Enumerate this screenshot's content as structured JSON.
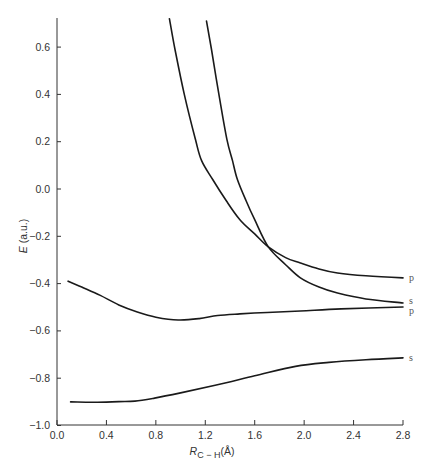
{
  "chart_data": {
    "type": "line",
    "title": "",
    "xlabel": "R_C−H (Å)",
    "xlabel_main": "R",
    "xlabel_sub": "C − H",
    "xlabel_unit": "(Å)",
    "ylabel": "E (a.u.)",
    "ylabel_main": "E",
    "ylabel_unit": "(a.u.)",
    "xlim": [
      0.0,
      2.8
    ],
    "ylim": [
      -1.0,
      0.72
    ],
    "grid": false,
    "legend": "none (curves labeled at right end)",
    "x_ticks": [
      "0.0",
      "0.4",
      "0.8",
      "1.2",
      "1.6",
      "2.0",
      "2.4",
      "2.8"
    ],
    "y_ticks": [
      "0.6",
      "0.4",
      "0.2",
      "0.0",
      "−0.2",
      "−0.4",
      "−0.6",
      "−0.8",
      "−1.0"
    ],
    "series": [
      {
        "name": "p (upper, repulsive)",
        "end_label": "p",
        "x": [
          0.91,
          0.955,
          1.03,
          1.12,
          1.17,
          1.26,
          1.37,
          1.48,
          1.6,
          1.71,
          1.85,
          1.97,
          2.12,
          2.27,
          2.5,
          2.8
        ],
        "y": [
          0.72,
          0.59,
          0.4,
          0.21,
          0.12,
          0.04,
          -0.05,
          -0.13,
          -0.19,
          -0.245,
          -0.29,
          -0.313,
          -0.338,
          -0.355,
          -0.367,
          -0.376
        ]
      },
      {
        "name": "s (upper, repulsive)",
        "end_label": "s",
        "x": [
          1.21,
          1.25,
          1.31,
          1.375,
          1.42,
          1.46,
          1.53,
          1.6,
          1.71,
          1.85,
          1.97,
          2.12,
          2.27,
          2.5,
          2.8
        ],
        "y": [
          0.71,
          0.59,
          0.4,
          0.21,
          0.12,
          0.04,
          -0.05,
          -0.13,
          -0.245,
          -0.32,
          -0.376,
          -0.415,
          -0.44,
          -0.465,
          -0.482
        ]
      },
      {
        "name": "p (lower)",
        "end_label": "p",
        "x": [
          0.09,
          0.2,
          0.35,
          0.5,
          0.65,
          0.8,
          0.98,
          1.15,
          1.3,
          1.48,
          1.7,
          1.97,
          2.3,
          2.8
        ],
        "y": [
          -0.39,
          -0.415,
          -0.45,
          -0.49,
          -0.52,
          -0.542,
          -0.554,
          -0.548,
          -0.535,
          -0.528,
          -0.522,
          -0.516,
          -0.507,
          -0.499
        ]
      },
      {
        "name": "s (lower)",
        "end_label": "s",
        "x": [
          0.11,
          0.3,
          0.5,
          0.63,
          0.79,
          1.0,
          1.28,
          1.6,
          1.93,
          2.2,
          2.5,
          2.8
        ],
        "y": [
          -0.9,
          -0.902,
          -0.899,
          -0.897,
          -0.884,
          -0.862,
          -0.83,
          -0.79,
          -0.75,
          -0.733,
          -0.722,
          -0.714
        ]
      }
    ],
    "annotations": [
      {
        "text": "p",
        "x": 2.8,
        "y": -0.376
      },
      {
        "text": "s",
        "x": 2.8,
        "y": -0.482
      },
      {
        "text": "p",
        "x": 2.8,
        "y": -0.499
      },
      {
        "text": "s",
        "x": 2.8,
        "y": -0.714
      }
    ],
    "crossing_point": {
      "x": 1.71,
      "y": -0.245
    }
  }
}
